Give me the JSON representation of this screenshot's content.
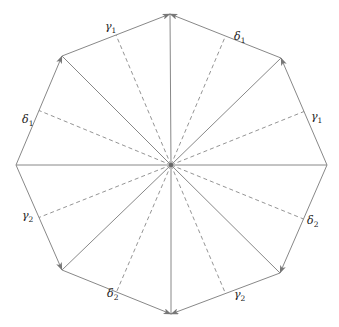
{
  "diagram": {
    "title": "",
    "center": {
      "x": 171,
      "y": 165
    },
    "vertices": [
      {
        "id": "V0",
        "x": 170,
        "y": 14
      },
      {
        "id": "V1",
        "x": 281,
        "y": 58
      },
      {
        "id": "V2",
        "x": 327,
        "y": 165
      },
      {
        "id": "V3",
        "x": 280,
        "y": 273
      },
      {
        "id": "V4",
        "x": 171,
        "y": 314
      },
      {
        "id": "V5",
        "x": 62,
        "y": 270
      },
      {
        "id": "V6",
        "x": 16,
        "y": 165
      },
      {
        "id": "V7",
        "x": 62,
        "y": 56
      }
    ],
    "edges": [
      {
        "from": "V7",
        "to": "V0",
        "label": "γ",
        "sub": "1",
        "lx": 105,
        "ly": 30
      },
      {
        "from": "V1",
        "to": "V0",
        "label": "δ",
        "sub": "1",
        "lx": 234,
        "ly": 40
      },
      {
        "from": "V2",
        "to": "V1",
        "label": "γ",
        "sub": "1",
        "lx": 311,
        "ly": 120
      },
      {
        "from": "V2",
        "to": "V3",
        "label": "δ",
        "sub": "2",
        "lx": 307,
        "ly": 224
      },
      {
        "from": "V3",
        "to": "V4",
        "label": "γ",
        "sub": "2",
        "lx": 234,
        "ly": 298
      },
      {
        "from": "V5",
        "to": "V4",
        "label": "δ",
        "sub": "2",
        "lx": 107,
        "ly": 297
      },
      {
        "from": "V6",
        "to": "V5",
        "label": "γ",
        "sub": "2",
        "lx": 22,
        "ly": 219
      },
      {
        "from": "V6",
        "to": "V7",
        "label": "δ",
        "sub": "1",
        "lx": 22,
        "ly": 123
      }
    ],
    "colors": {
      "stroke": "#888888",
      "dash": "#888888",
      "text": "#222222"
    }
  }
}
